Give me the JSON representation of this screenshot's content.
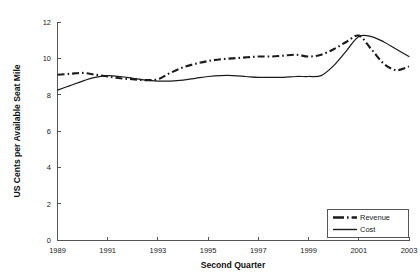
{
  "chart_data": {
    "type": "line",
    "title": "",
    "xlabel": "Second Quarter",
    "ylabel": "US Cents per Available Seat Mile",
    "xlim": [
      1989,
      2003
    ],
    "ylim": [
      0,
      12
    ],
    "grid": false,
    "legend_position": "bottom-right",
    "xticks": [
      "1989",
      "1991",
      "1993",
      "1995",
      "1997",
      "1999",
      "2001",
      "2003"
    ],
    "xtick_values": [
      1989,
      1991,
      1993,
      1995,
      1997,
      1999,
      2001,
      2003
    ],
    "yticks": [
      "0",
      "2",
      "4",
      "6",
      "8",
      "10",
      "12"
    ],
    "ytick_values": [
      0,
      2,
      4,
      6,
      8,
      10,
      12
    ],
    "x": [
      1989,
      1989.5,
      1990,
      1990.5,
      1991,
      1991.5,
      1992,
      1992.5,
      1993,
      1993.5,
      1994,
      1994.5,
      1995,
      1995.5,
      1996,
      1996.5,
      1997,
      1997.5,
      1998,
      1998.5,
      1999,
      1999.5,
      2000,
      2000.5,
      2001,
      2001.5,
      2002,
      2002.5,
      2003
    ],
    "series": [
      {
        "name": "Revenue",
        "style": "dash-dot",
        "values": [
          9.1,
          9.15,
          9.2,
          9.1,
          9.0,
          8.9,
          8.85,
          8.8,
          8.85,
          9.2,
          9.5,
          9.7,
          9.85,
          9.95,
          10.0,
          10.05,
          10.1,
          10.1,
          10.15,
          10.2,
          10.1,
          10.2,
          10.5,
          10.9,
          11.25,
          10.5,
          9.7,
          9.35,
          9.55
        ]
      },
      {
        "name": "Cost",
        "style": "solid",
        "values": [
          8.25,
          8.5,
          8.75,
          8.95,
          9.05,
          9.0,
          8.9,
          8.8,
          8.75,
          8.75,
          8.8,
          8.9,
          9.0,
          9.05,
          9.05,
          9.0,
          8.95,
          8.95,
          8.95,
          9.0,
          9.0,
          9.05,
          9.6,
          10.4,
          11.2,
          11.2,
          10.9,
          10.5,
          10.1
        ]
      }
    ]
  },
  "legend": {
    "items": [
      {
        "label": "Revenue",
        "style": "dash-dot"
      },
      {
        "label": "Cost",
        "style": "solid"
      }
    ]
  }
}
